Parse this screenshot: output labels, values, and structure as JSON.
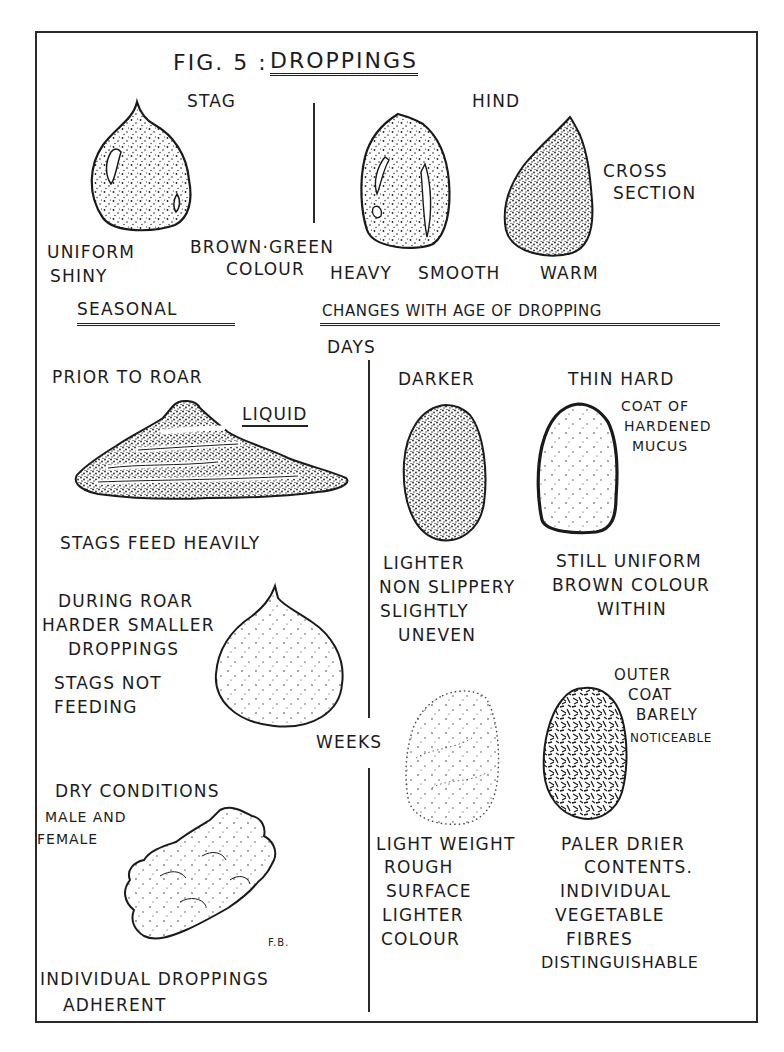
{
  "figure": {
    "title_prefix": "FIG. 5 :",
    "title": "DROPPINGS",
    "initials": "F.B."
  },
  "top_section": {
    "stag": {
      "heading": "STAG",
      "labels": [
        "UNIFORM",
        "SHINY"
      ],
      "colour_label": [
        "BROWN·GREEN",
        "COLOUR"
      ]
    },
    "hind": {
      "heading": "HIND",
      "labels": [
        "HEAVY",
        "SMOOTH",
        "WARM"
      ],
      "cross_section": [
        "CROSS",
        "SECTION"
      ]
    }
  },
  "section_headings": {
    "seasonal": "SEASONAL",
    "age": "CHANGES WITH AGE OF DROPPING"
  },
  "seasonal": {
    "prior_to_roar": {
      "heading": "PRIOR TO ROAR",
      "consistency": "LIQUID",
      "note": "STAGS FEED HEAVILY"
    },
    "during_roar": {
      "heading": "DURING ROAR",
      "lines": [
        "HARDER SMALLER",
        "DROPPINGS"
      ],
      "note": [
        "STAGS NOT",
        "FEEDING"
      ]
    },
    "dry_conditions": {
      "lines": [
        "DRY CONDITIONS",
        "MALE AND",
        "FEMALE"
      ],
      "note": [
        "INDIVIDUAL DROPPINGS",
        "ADHERENT"
      ]
    }
  },
  "age": {
    "days": {
      "heading": "DAYS",
      "left": {
        "top": "DARKER",
        "bottom": [
          "LIGHTER",
          "NON SLIPPERY",
          "SLIGHTLY",
          "UNEVEN"
        ]
      },
      "right": {
        "top": "THIN HARD",
        "side": [
          "COAT OF",
          "HARDENED",
          "MUCUS"
        ],
        "bottom": [
          "STILL UNIFORM",
          "BROWN COLOUR",
          "WITHIN"
        ]
      }
    },
    "weeks": {
      "heading": "WEEKS",
      "left": {
        "bottom": [
          "LIGHT WEIGHT",
          "ROUGH",
          "SURFACE",
          "LIGHTER",
          "COLOUR"
        ]
      },
      "right": {
        "side": [
          "OUTER",
          "COAT",
          "BARELY",
          "NOTICEABLE"
        ],
        "bottom": [
          "PALER DRIER",
          "CONTENTS.",
          "INDIVIDUAL",
          "VEGETABLE",
          "FIBRES",
          "DISTINGUISHABLE"
        ]
      }
    }
  },
  "colors": {
    "ink": "#1c1c1c",
    "paper": "#ffffff"
  }
}
